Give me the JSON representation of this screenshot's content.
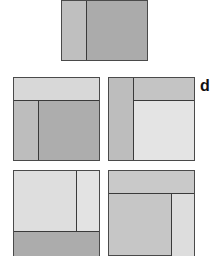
{
  "colors": {
    "dark": "#a9a9a9",
    "medium": "#bdbdbd",
    "light": "#dadada",
    "lighter": "#e2e2e2",
    "border": "#4a4a4a"
  },
  "label": "d",
  "panels": [
    {
      "id": "top",
      "regions": [
        "left-strip-medium",
        "right-dark"
      ]
    },
    {
      "id": "middle-left",
      "regions": [
        "top-band-light",
        "left-strip-medium",
        "right-dark"
      ]
    },
    {
      "id": "middle-right",
      "regions": [
        "left-strip-medium",
        "top-band-medium",
        "main-lighter"
      ]
    },
    {
      "id": "bottom-left",
      "regions": [
        "main-lighter",
        "right-strip-lighter",
        "bottom-band-dark"
      ]
    },
    {
      "id": "bottom-right",
      "regions": [
        "top-band-medium",
        "main-medium",
        "right-strip-light"
      ]
    }
  ]
}
